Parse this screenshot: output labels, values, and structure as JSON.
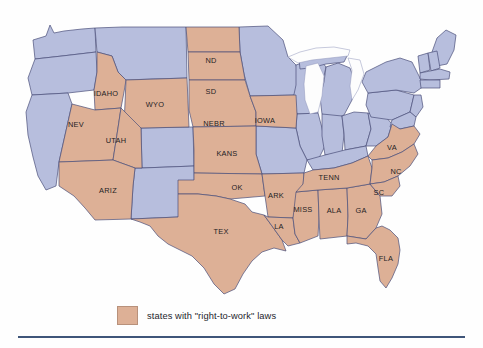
{
  "figure": {
    "kind": "choropleth-map",
    "region": "United States (contiguous 48 states)",
    "background_color": "#fefefe"
  },
  "colors": {
    "right_to_work_fill": "#ddb096",
    "other_state_fill": "#b7bedd",
    "border_stroke": "#4a4f7a",
    "label_text": "#1d1d24",
    "lake_fill": "#fdfdfd",
    "rule_color": "#3f5579"
  },
  "legend": {
    "swatch_color": "#ddb096",
    "text": "states with \"right-to-work\" laws"
  },
  "map": {
    "labels": [
      {
        "id": "idaho",
        "text": "IDAHO",
        "x": 106,
        "y": 94,
        "category": "right-to-work"
      },
      {
        "id": "wyo",
        "text": "WYO",
        "x": 155,
        "y": 105,
        "category": "right-to-work"
      },
      {
        "id": "nd",
        "text": "ND",
        "x": 211,
        "y": 61,
        "category": "right-to-work"
      },
      {
        "id": "sd",
        "text": "SD",
        "x": 211,
        "y": 92,
        "category": "right-to-work"
      },
      {
        "id": "nebr",
        "text": "NEBR",
        "x": 214,
        "y": 124,
        "category": "right-to-work"
      },
      {
        "id": "iowa",
        "text": "IOWA",
        "x": 265,
        "y": 121,
        "category": "right-to-work"
      },
      {
        "id": "kans",
        "text": "KANS",
        "x": 227,
        "y": 154,
        "category": "right-to-work"
      },
      {
        "id": "nev",
        "text": "NEV",
        "x": 76,
        "y": 125,
        "category": "right-to-work"
      },
      {
        "id": "utah",
        "text": "UTAH",
        "x": 116,
        "y": 141,
        "category": "right-to-work"
      },
      {
        "id": "ariz",
        "text": "ARIZ",
        "x": 108,
        "y": 191,
        "category": "right-to-work"
      },
      {
        "id": "ok",
        "text": "OK",
        "x": 237,
        "y": 188,
        "category": "right-to-work"
      },
      {
        "id": "tex",
        "text": "TEX",
        "x": 221,
        "y": 232,
        "category": "right-to-work"
      },
      {
        "id": "ark",
        "text": "ARK",
        "x": 276,
        "y": 196,
        "category": "right-to-work"
      },
      {
        "id": "la",
        "text": "LA",
        "x": 279,
        "y": 227,
        "category": "right-to-work"
      },
      {
        "id": "miss",
        "text": "MISS",
        "x": 303,
        "y": 210,
        "category": "right-to-work"
      },
      {
        "id": "ala",
        "text": "ALA",
        "x": 334,
        "y": 211,
        "category": "right-to-work"
      },
      {
        "id": "ga",
        "text": "GA",
        "x": 361,
        "y": 211,
        "category": "right-to-work"
      },
      {
        "id": "tenn",
        "text": "TENN",
        "x": 329,
        "y": 178,
        "category": "right-to-work"
      },
      {
        "id": "va",
        "text": "VA",
        "x": 392,
        "y": 148,
        "category": "right-to-work"
      },
      {
        "id": "nc",
        "text": "NC",
        "x": 396,
        "y": 172,
        "category": "right-to-work"
      },
      {
        "id": "sc",
        "text": "SC",
        "x": 379,
        "y": 193,
        "category": "right-to-work"
      },
      {
        "id": "fla",
        "text": "FLA",
        "x": 386,
        "y": 259,
        "category": "right-to-work"
      }
    ],
    "right_to_work_states": [
      "Idaho",
      "Wyoming",
      "North Dakota",
      "South Dakota",
      "Nebraska",
      "Iowa",
      "Kansas",
      "Nevada",
      "Utah",
      "Arizona",
      "Oklahoma",
      "Texas",
      "Arkansas",
      "Louisiana",
      "Mississippi",
      "Alabama",
      "Georgia",
      "Tennessee",
      "Virginia",
      "North Carolina",
      "South Carolina",
      "Florida"
    ],
    "other_states": [
      "Washington",
      "Oregon",
      "California",
      "Montana",
      "Colorado",
      "New Mexico",
      "Minnesota",
      "Wisconsin",
      "Michigan",
      "Illinois",
      "Indiana",
      "Ohio",
      "Missouri",
      "Kentucky",
      "West Virginia",
      "Pennsylvania",
      "New York",
      "Maine",
      "Vermont",
      "New Hampshire",
      "Massachusetts",
      "Rhode Island",
      "Connecticut",
      "New Jersey",
      "Delaware",
      "Maryland"
    ]
  }
}
